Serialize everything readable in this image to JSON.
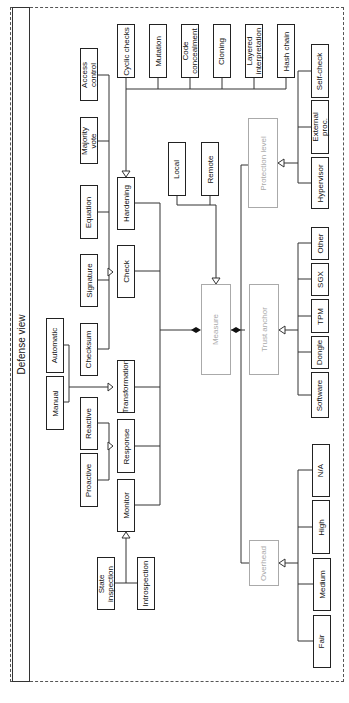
{
  "title": "Defense view",
  "nodes": {
    "access_control": "Access\ncontrol",
    "majority_vote": "Majority\nvote",
    "equation": "Equation",
    "signature": "Signature",
    "checksum": "Checksum",
    "automatic": "Automatic",
    "manual": "Manual",
    "reactive": "Reactive",
    "proactive": "Proactive",
    "cyclic_checks": "Cyclic checks",
    "mutation": "Mutation",
    "code_concealment": "Code\nconcealment",
    "cloning": "Cloning",
    "layered_interpretation": "Layered\ninterpretation",
    "hash_chain": "Hash chain",
    "hardening": "Hardening",
    "check": "Check",
    "transformation": "Transformation",
    "response": "Response",
    "monitor": "Monitor",
    "state_inspection": "State\ninspection",
    "introspection": "Introspection",
    "local": "Local",
    "remote": "Remote",
    "measure": "Measure",
    "protection_level": "Protection level",
    "trust_anchor": "Trust anchor",
    "overhead": "Overhead",
    "self_check": "Self-check",
    "external_proc": "External\nproc.",
    "hypervisor": "Hypervisor",
    "other": "Other",
    "sgx": "SGX",
    "tpm": "TPM",
    "dongle": "Dongle",
    "software": "Software",
    "na": "N/A",
    "high": "High",
    "medium": "Medium",
    "fair": "Fair"
  },
  "colors": {
    "line": "#333333",
    "grey_node": "#aaaaaa"
  }
}
